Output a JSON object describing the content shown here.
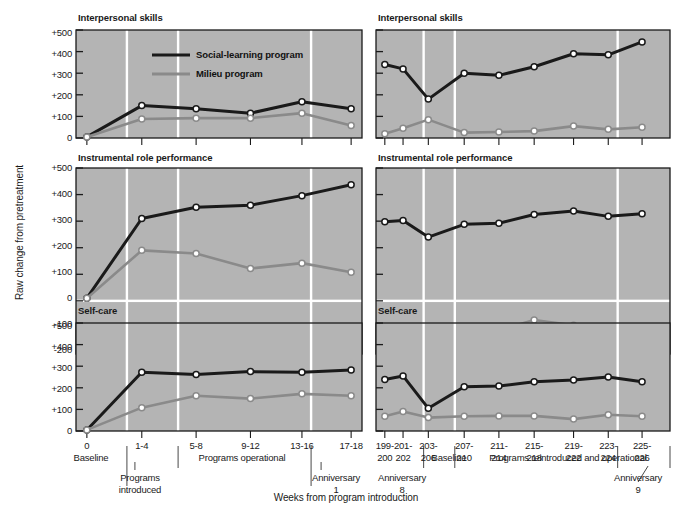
{
  "figure": {
    "y_axis_label": "Raw change from pretreatment",
    "x_axis_label": "Weeks from program introduction",
    "background_color": "#b4b4b4",
    "series_colors": {
      "social_learning": "#1a1a1a",
      "milieu": "#8a8a8a"
    }
  },
  "legend": {
    "items": [
      {
        "label": "Social-learning program",
        "color": "#1a1a1a",
        "key": "social_learning"
      },
      {
        "label": "Milieu program",
        "color": "#8a8a8a",
        "key": "milieu"
      }
    ]
  },
  "left_axis": {
    "ticks_a": [
      "+500",
      "+400",
      "+300",
      "+200",
      "+100",
      "0"
    ],
    "ticks_b": [
      "+500",
      "+400",
      "+300",
      "+200",
      "+100",
      "0",
      "-100",
      "-200"
    ],
    "ticks_c": [
      "+500",
      "+400",
      "+300",
      "+200",
      "+100",
      "0"
    ]
  },
  "annotations_left": {
    "baseline": "Baseline",
    "programs_introduced_line1": "Programs",
    "programs_introduced_line2": "introduced",
    "programs_operational": "Programs operational",
    "anniversary_line1": "Anniversary",
    "anniversary_line2": "1"
  },
  "annotations_right": {
    "anniversary8_line1": "Anniversary",
    "anniversary8_line2": "8",
    "baseline": "Baseline",
    "reintroduced": "Programs reintroduced and operational",
    "anniversary9_line1": "Anniversary",
    "anniversary9_line2": "9"
  },
  "chart_data": [
    {
      "id": "left-interpersonal",
      "type": "line",
      "title": "Interpersonal skills",
      "xlabel": "Weeks from program introduction",
      "ylabel": "Raw change from pretreatment",
      "ylim": [
        0,
        500
      ],
      "yticks": [
        0,
        100,
        200,
        300,
        400,
        500
      ],
      "categories": [
        "0",
        "1-4",
        "5-8",
        "9-12",
        "13-16",
        "17-18"
      ],
      "grid": false,
      "legend": "inside-top-right",
      "series": [
        {
          "name": "Social-learning program",
          "color": "#1a1a1a",
          "values": [
            5,
            150,
            135,
            115,
            168,
            135
          ]
        },
        {
          "name": "Milieu program",
          "color": "#8a8a8a",
          "values": [
            5,
            88,
            92,
            92,
            115,
            58
          ]
        }
      ]
    },
    {
      "id": "right-interpersonal",
      "type": "line",
      "title": "Interpersonal skills",
      "xlabel": "Weeks from program introduction",
      "ylabel": "Raw change from pretreatment",
      "ylim": [
        0,
        500
      ],
      "yticks": [
        0,
        100,
        200,
        300,
        400,
        500
      ],
      "categories": [
        "199-200",
        "201-202",
        "203-206",
        "207-210",
        "211-214",
        "215-218",
        "219-222",
        "223-224",
        "225-226"
      ],
      "grid": false,
      "legend": "none",
      "series": [
        {
          "name": "Social-learning program",
          "color": "#1a1a1a",
          "values": [
            340,
            320,
            180,
            300,
            290,
            330,
            390,
            385,
            445
          ]
        },
        {
          "name": "Milieu program",
          "color": "#8a8a8a",
          "values": [
            20,
            45,
            85,
            25,
            28,
            32,
            55,
            40,
            50
          ]
        }
      ]
    },
    {
      "id": "left-instrumental",
      "type": "line",
      "title": "Instrumental role performance",
      "xlabel": "Weeks from program introduction",
      "ylabel": "Raw change from pretreatment",
      "ylim": [
        -200,
        500
      ],
      "yticks": [
        -200,
        -100,
        0,
        100,
        200,
        300,
        400,
        500
      ],
      "categories": [
        "0",
        "1-4",
        "5-8",
        "9-12",
        "13-16",
        "17-18"
      ],
      "grid": false,
      "legend": "none",
      "series": [
        {
          "name": "Social-learning program",
          "color": "#1a1a1a",
          "values": [
            10,
            310,
            352,
            360,
            396,
            437
          ]
        },
        {
          "name": "Milieu program",
          "color": "#8a8a8a",
          "values": [
            10,
            190,
            178,
            122,
            142,
            108
          ]
        }
      ]
    },
    {
      "id": "right-instrumental",
      "type": "line",
      "title": "Instrumental role performance",
      "xlabel": "Weeks from program introduction",
      "ylabel": "Raw change from pretreatment",
      "ylim": [
        -200,
        500
      ],
      "yticks": [
        -200,
        -100,
        0,
        100,
        200,
        300,
        400,
        500
      ],
      "categories": [
        "199-200",
        "201-202",
        "203-206",
        "207-210",
        "211-214",
        "215-218",
        "219-222",
        "223-224",
        "225-226"
      ],
      "grid": false,
      "legend": "none",
      "series": [
        {
          "name": "Social-learning program",
          "color": "#1a1a1a",
          "values": [
            298,
            302,
            240,
            288,
            292,
            325,
            338,
            318,
            328
          ]
        },
        {
          "name": "Milieu program",
          "color": "#8a8a8a",
          "values": [
            -145,
            -135,
            -172,
            -145,
            -110,
            -72,
            -92,
            -100,
            -130
          ]
        }
      ]
    },
    {
      "id": "left-selfcare",
      "type": "line",
      "title": "Self-care",
      "xlabel": "Weeks from program introduction",
      "ylabel": "Raw change from pretreatment",
      "ylim": [
        0,
        500
      ],
      "yticks": [
        0,
        100,
        200,
        300,
        400,
        500
      ],
      "categories": [
        "0",
        "1-4",
        "5-8",
        "9-12",
        "13-16",
        "17-18"
      ],
      "grid": false,
      "legend": "none",
      "series": [
        {
          "name": "Social-learning program",
          "color": "#1a1a1a",
          "values": [
            5,
            272,
            262,
            275,
            272,
            282
          ]
        },
        {
          "name": "Milieu program",
          "color": "#8a8a8a",
          "values": [
            5,
            108,
            163,
            150,
            172,
            163
          ]
        }
      ]
    },
    {
      "id": "right-selfcare",
      "type": "line",
      "title": "Self-care",
      "xlabel": "Weeks from program introduction",
      "ylabel": "Raw change from pretreatment",
      "ylim": [
        0,
        500
      ],
      "yticks": [
        0,
        100,
        200,
        300,
        400,
        500
      ],
      "categories": [
        "199-200",
        "201-202",
        "203-206",
        "207-210",
        "211-214",
        "215-218",
        "219-222",
        "223-224",
        "225-226"
      ],
      "grid": false,
      "legend": "none",
      "series": [
        {
          "name": "Social-learning program",
          "color": "#1a1a1a",
          "values": [
            238,
            255,
            105,
            205,
            208,
            228,
            236,
            250,
            228
          ]
        },
        {
          "name": "Milieu program",
          "color": "#8a8a8a",
          "values": [
            68,
            90,
            62,
            68,
            70,
            70,
            55,
            75,
            68
          ]
        }
      ]
    }
  ],
  "x_tick_labels_left": [
    {
      "line1": "0",
      "line2": ""
    },
    {
      "line1": "1-4",
      "line2": ""
    },
    {
      "line1": "5-8",
      "line2": ""
    },
    {
      "line1": "9-12",
      "line2": ""
    },
    {
      "line1": "13-16",
      "line2": ""
    },
    {
      "line1": "17-18",
      "line2": ""
    }
  ],
  "x_tick_labels_right": [
    {
      "line1": "199-",
      "line2": "200"
    },
    {
      "line1": "201-",
      "line2": "202"
    },
    {
      "line1": "203-",
      "line2": "206"
    },
    {
      "line1": "207-",
      "line2": "210"
    },
    {
      "line1": "211-",
      "line2": "214"
    },
    {
      "line1": "215-",
      "line2": "218"
    },
    {
      "line1": "219-",
      "line2": "222"
    },
    {
      "line1": "223-",
      "line2": "224"
    },
    {
      "line1": "225-",
      "line2": "226"
    }
  ]
}
